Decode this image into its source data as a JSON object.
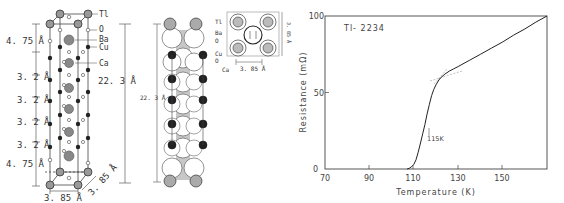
{
  "figure": {
    "panel_a": {
      "title": "Tl-2234 unit cell (ball-and-stick)",
      "atom_labels": [
        "Tl",
        "O",
        "Ba",
        "Cu",
        "Ca"
      ],
      "layer_spacings": [
        "4. 75 Å",
        "3. 2 Å",
        "3. 2 Å",
        "3. 2 Å",
        "3. 2 Å",
        "4. 75 Å"
      ],
      "c_axis": "22. 3 Å",
      "a_axis": "3. 85 Å",
      "b_axis": "3. 85 Å"
    },
    "panel_b": {
      "title": "Tl-2234 unit cell (space-filling)",
      "atom_labels": [
        "Tl",
        "Ba",
        "O",
        "Cu",
        "O",
        "Ca"
      ],
      "c_axis": "22. 3 Å",
      "inset_axis": "3. 85 Å",
      "inset_height": "3. 85 Å"
    },
    "panel_c": {
      "sample_label": "Tl- 2234",
      "tc_annotation": "115K",
      "xlabel": "Temperature (K)",
      "ylabel": "Resistance (mΩ)",
      "x_ticks": [
        "70",
        "90",
        "110",
        "130",
        "150"
      ],
      "y_ticks": [
        "0",
        "50",
        "100"
      ]
    }
  },
  "chart_data": {
    "type": "line",
    "title": "Tl- 2234",
    "xlabel": "Temperature (K)",
    "ylabel": "Resistance (mΩ)",
    "xlim": [
      70,
      170
    ],
    "ylim": [
      0,
      100
    ],
    "x_ticks": [
      70,
      90,
      110,
      130,
      150
    ],
    "y_ticks": [
      0,
      50,
      100
    ],
    "grid": false,
    "legend": "none",
    "annotations": [
      {
        "text": "115K",
        "x": 115,
        "y": 28,
        "note": "arrow marking midpoint of transition"
      },
      {
        "text": "onset tangent lines crossing",
        "x": 120,
        "y": 58
      }
    ],
    "series": [
      {
        "name": "Tl-2234 resistance",
        "x": [
          107,
          108,
          109,
          110,
          111,
          112,
          113,
          114,
          115,
          116,
          117,
          118,
          119,
          120,
          121,
          122,
          124,
          126,
          128,
          130,
          135,
          140,
          145,
          150,
          155,
          160,
          165,
          170
        ],
        "y": [
          0,
          0.5,
          1.5,
          3,
          6,
          11,
          17,
          23,
          29,
          36,
          42,
          48,
          52,
          55,
          57.5,
          59.5,
          62,
          64,
          65.5,
          67,
          71,
          75,
          79,
          83,
          87.5,
          91.5,
          96,
          100
        ]
      }
    ]
  }
}
